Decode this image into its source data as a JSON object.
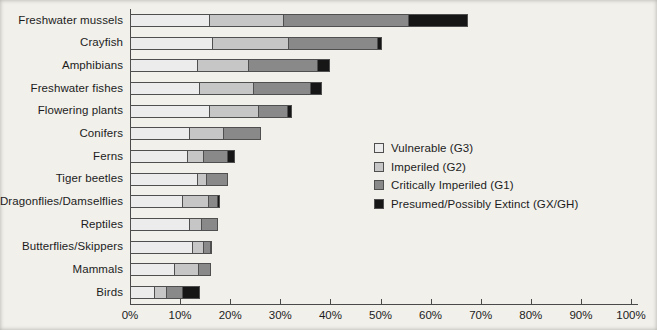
{
  "chart_data": {
    "type": "bar",
    "orientation": "horizontal",
    "stacked": true,
    "title": "",
    "xlabel": "",
    "ylabel": "",
    "xlim": [
      0,
      100
    ],
    "grid": false,
    "legend_position": "center-right",
    "x_ticks": [
      "0%",
      "10%",
      "20%",
      "30%",
      "40%",
      "50%",
      "60%",
      "70%",
      "80%",
      "90%",
      "100%"
    ],
    "categories": [
      "Freshwater mussels",
      "Crayfish",
      "Amphibians",
      "Freshwater fishes",
      "Flowering plants",
      "Conifers",
      "Ferns",
      "Tiger beetles",
      "Dragonflies/Damselflies",
      "Reptiles",
      "Butterflies/Skippers",
      "Mammals",
      "Birds"
    ],
    "series": [
      {
        "name": "Vulnerable (G3)",
        "color": "#ececec",
        "values": [
          16,
          16.5,
          13.5,
          14,
          16,
          12,
          11.5,
          13.5,
          10.5,
          12,
          12.5,
          9,
          5
        ]
      },
      {
        "name": "Imperiled (G2)",
        "color": "#c6c6c6",
        "values": [
          15,
          15.5,
          10.5,
          11,
          10,
          7,
          3.5,
          2,
          5.5,
          2.5,
          2.5,
          5,
          2.5
        ]
      },
      {
        "name": "Critically Imperiled (G1)",
        "color": "#898989",
        "values": [
          25,
          18,
          14,
          11.5,
          6,
          7.5,
          5,
          4.5,
          2,
          3.5,
          1.5,
          2.5,
          3.5
        ]
      },
      {
        "name": "Presumed/Possibly Extinct (GX/GH)",
        "color": "#161616",
        "values": [
          12,
          1,
          2.5,
          2.5,
          1,
          0,
          1.5,
          0,
          0.5,
          0,
          0.5,
          0,
          3.5
        ]
      }
    ]
  },
  "colors": {
    "axis": "#4a4a4a",
    "background": "#f1f0eb",
    "text": "#1c1c1c"
  }
}
